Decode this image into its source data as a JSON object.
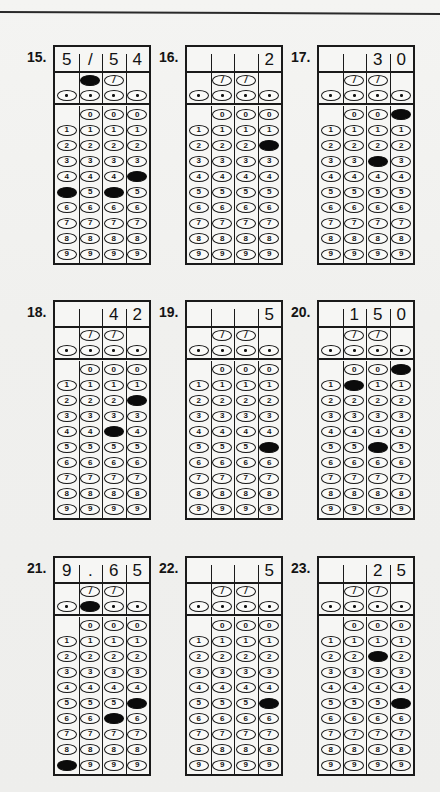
{
  "page": {
    "background_color": "#f1f1ef",
    "ink_color": "#141414",
    "has_top_rule": true
  },
  "glyphs": {
    "fraction_bar": "/",
    "decimal_point": "·",
    "digits": [
      "0",
      "1",
      "2",
      "3",
      "4",
      "5",
      "6",
      "7",
      "8",
      "9"
    ]
  },
  "grid_spec": {
    "columns": 4,
    "rows": [
      "fraction-bar",
      "decimal-point",
      "0",
      "1",
      "2",
      "3",
      "4",
      "5",
      "6",
      "7",
      "8",
      "9"
    ],
    "fraction_bar_columns": [
      1,
      2
    ],
    "zero_columns": [
      1,
      2,
      3
    ],
    "note": "column indices are zero-based; column 0 has no fraction-bar and no zero bubble"
  },
  "questions": [
    {
      "number": "15.",
      "answer_text": [
        "5",
        "/",
        "5",
        "4"
      ],
      "fraction_bar_filled": [
        false,
        true,
        false,
        false
      ],
      "fraction_bar_present": [
        false,
        true,
        true,
        false
      ],
      "decimal_filled": [
        false,
        false,
        false,
        false
      ],
      "digit_filled": [
        5,
        null,
        5,
        4
      ],
      "filled_labels": [
        "5",
        "/",
        "5",
        "4"
      ]
    },
    {
      "number": "16.",
      "answer_text": [
        "",
        "",
        "",
        "2"
      ],
      "fraction_bar_filled": [
        false,
        false,
        false,
        false
      ],
      "fraction_bar_present": [
        false,
        true,
        true,
        false
      ],
      "decimal_filled": [
        false,
        false,
        false,
        false
      ],
      "digit_filled": [
        null,
        null,
        null,
        2
      ],
      "filled_labels": [
        "",
        "",
        "",
        "2"
      ]
    },
    {
      "number": "17.",
      "answer_text": [
        "",
        "",
        "3",
        "0"
      ],
      "fraction_bar_filled": [
        false,
        false,
        false,
        false
      ],
      "fraction_bar_present": [
        false,
        true,
        true,
        false
      ],
      "decimal_filled": [
        false,
        false,
        false,
        false
      ],
      "digit_filled": [
        null,
        null,
        3,
        0
      ],
      "filled_labels": [
        "",
        "",
        "3",
        "0"
      ]
    },
    {
      "number": "18.",
      "answer_text": [
        "",
        "",
        "4",
        "2"
      ],
      "fraction_bar_filled": [
        false,
        false,
        false,
        false
      ],
      "fraction_bar_present": [
        false,
        true,
        true,
        false
      ],
      "decimal_filled": [
        false,
        false,
        false,
        false
      ],
      "digit_filled": [
        null,
        null,
        4,
        2
      ],
      "filled_labels": [
        "",
        "",
        "4",
        "2"
      ]
    },
    {
      "number": "19.",
      "answer_text": [
        "",
        "",
        "",
        "5"
      ],
      "fraction_bar_filled": [
        false,
        false,
        false,
        false
      ],
      "fraction_bar_present": [
        false,
        true,
        true,
        false
      ],
      "decimal_filled": [
        false,
        false,
        false,
        false
      ],
      "digit_filled": [
        null,
        null,
        null,
        5
      ],
      "filled_labels": [
        "",
        "",
        "",
        "5"
      ]
    },
    {
      "number": "20.",
      "answer_text": [
        "",
        "1",
        "5",
        "0"
      ],
      "fraction_bar_filled": [
        false,
        false,
        false,
        false
      ],
      "fraction_bar_present": [
        false,
        true,
        true,
        false
      ],
      "decimal_filled": [
        false,
        false,
        false,
        false
      ],
      "digit_filled": [
        null,
        1,
        5,
        0
      ],
      "filled_labels": [
        "",
        "1",
        "5",
        "0"
      ]
    },
    {
      "number": "21.",
      "answer_text": [
        "9",
        ".",
        "6",
        "5"
      ],
      "fraction_bar_filled": [
        false,
        false,
        false,
        false
      ],
      "fraction_bar_present": [
        false,
        true,
        true,
        false
      ],
      "decimal_filled": [
        false,
        true,
        false,
        false
      ],
      "digit_filled": [
        9,
        null,
        6,
        5
      ],
      "filled_labels": [
        "9",
        ".",
        "6",
        "5"
      ]
    },
    {
      "number": "22.",
      "answer_text": [
        "",
        "",
        "",
        "5"
      ],
      "fraction_bar_filled": [
        false,
        false,
        false,
        false
      ],
      "fraction_bar_present": [
        false,
        true,
        true,
        false
      ],
      "decimal_filled": [
        false,
        false,
        false,
        false
      ],
      "digit_filled": [
        null,
        null,
        null,
        5
      ],
      "filled_labels": [
        "",
        "",
        "",
        "5"
      ]
    },
    {
      "number": "23.",
      "answer_text": [
        "",
        "",
        "2",
        "5"
      ],
      "fraction_bar_filled": [
        false,
        false,
        false,
        false
      ],
      "fraction_bar_present": [
        false,
        true,
        true,
        false
      ],
      "decimal_filled": [
        false,
        false,
        false,
        false
      ],
      "digit_filled": [
        null,
        null,
        2,
        5
      ],
      "filled_labels": [
        "",
        "",
        "2",
        "5"
      ]
    }
  ],
  "layout": {
    "columns_x": [
      27,
      159,
      291
    ],
    "rows_y": [
      45,
      300,
      556
    ]
  }
}
